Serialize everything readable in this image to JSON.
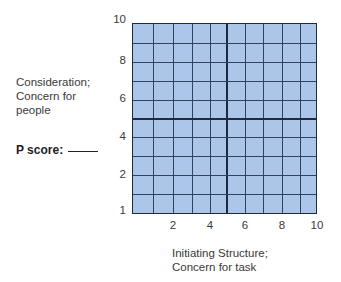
{
  "diagram": {
    "type": "leadership-grid",
    "y_axis": {
      "label_lines": [
        "Consideration;",
        "Concern for",
        "people"
      ],
      "ticks": [
        {
          "label": "10",
          "y": 20
        },
        {
          "label": "8",
          "y": 61
        },
        {
          "label": "6",
          "y": 99
        },
        {
          "label": "4",
          "y": 137
        },
        {
          "label": "2",
          "y": 175
        },
        {
          "label": "1",
          "y": 211
        }
      ]
    },
    "x_axis": {
      "label_lines": [
        "Initiating Structure;",
        "Concern for task"
      ],
      "ticks": [
        {
          "label": "2",
          "x": 173
        },
        {
          "label": "4",
          "x": 210
        },
        {
          "label": "6",
          "x": 245
        },
        {
          "label": "8",
          "x": 282
        },
        {
          "label": "10",
          "x": 317
        }
      ]
    },
    "p_score": {
      "label": "P score:",
      "value": ""
    },
    "grid": {
      "columns": 10,
      "rows": 10,
      "fill_color": "#abc6e8",
      "line_color": "#33425c"
    }
  }
}
